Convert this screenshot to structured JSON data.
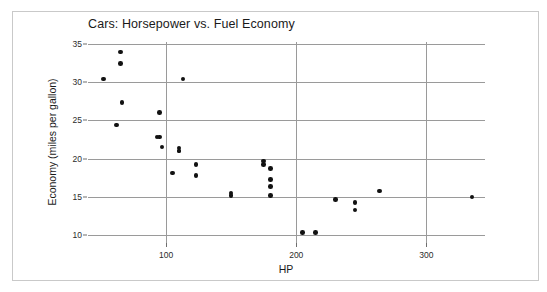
{
  "figure": {
    "background_color": "#ffffff",
    "frame_color": "#c9c9c9",
    "marker_color": "#121212",
    "grid_color": "#9a9a9a"
  },
  "chart_data": {
    "type": "scatter",
    "title": "Cars: Horsepower vs. Fuel Economy",
    "xlabel": "HP",
    "ylabel": "Economy (miles per gallon)",
    "xlim": [
      40,
      345
    ],
    "ylim": [
      9.0,
      35.2
    ],
    "xticks": [
      100,
      200,
      300
    ],
    "xtick_labels": [
      "100",
      "200",
      "300"
    ],
    "yticks": [
      10,
      15,
      20,
      25,
      30,
      35
    ],
    "ytick_labels": [
      "10",
      "15",
      "20",
      "25",
      "30",
      "35"
    ],
    "grid": "horizontal-and-vertical-at-ticks",
    "legend": "none",
    "series": [
      {
        "name": "cars",
        "points": [
          {
            "hp": 65,
            "mpg": 33.9
          },
          {
            "hp": 65,
            "mpg": 32.4
          },
          {
            "hp": 52,
            "mpg": 30.4
          },
          {
            "hp": 113,
            "mpg": 30.4
          },
          {
            "hp": 66,
            "mpg": 27.3
          },
          {
            "hp": 95,
            "mpg": 26.0
          },
          {
            "hp": 62,
            "mpg": 24.4
          },
          {
            "hp": 93,
            "mpg": 22.8
          },
          {
            "hp": 95,
            "mpg": 22.8
          },
          {
            "hp": 97,
            "mpg": 21.5
          },
          {
            "hp": 110,
            "mpg": 21.4
          },
          {
            "hp": 110,
            "mpg": 21.0
          },
          {
            "hp": 110,
            "mpg": 21.0
          },
          {
            "hp": 123,
            "mpg": 19.2
          },
          {
            "hp": 105,
            "mpg": 18.1
          },
          {
            "hp": 123,
            "mpg": 17.8
          },
          {
            "hp": 150,
            "mpg": 15.5
          },
          {
            "hp": 150,
            "mpg": 15.2
          },
          {
            "hp": 175,
            "mpg": 19.7
          },
          {
            "hp": 175,
            "mpg": 19.2
          },
          {
            "hp": 180,
            "mpg": 18.7
          },
          {
            "hp": 180,
            "mpg": 17.3
          },
          {
            "hp": 180,
            "mpg": 16.4
          },
          {
            "hp": 180,
            "mpg": 15.2
          },
          {
            "hp": 205,
            "mpg": 10.4
          },
          {
            "hp": 215,
            "mpg": 10.4
          },
          {
            "hp": 230,
            "mpg": 14.7
          },
          {
            "hp": 245,
            "mpg": 14.3
          },
          {
            "hp": 245,
            "mpg": 13.3
          },
          {
            "hp": 264,
            "mpg": 15.8
          },
          {
            "hp": 335,
            "mpg": 15.0
          }
        ]
      }
    ]
  }
}
